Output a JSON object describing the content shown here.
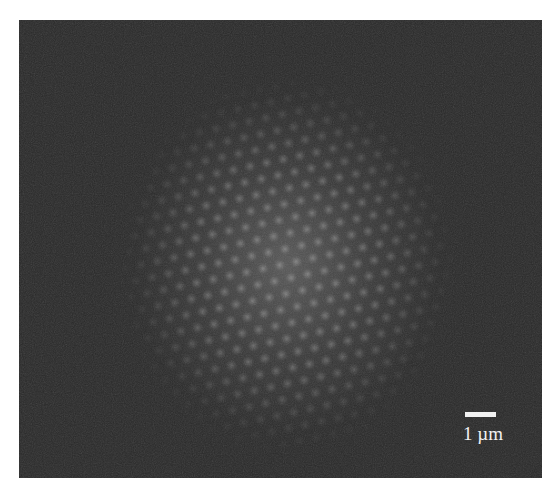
{
  "figure": {
    "background_color": "#292929",
    "glow_color": "#5f5f5f",
    "lattice": {
      "type": "hexagonal",
      "period_px": 17
    },
    "scale_bar": {
      "label": "1 µm",
      "color": "#f2f2f2"
    }
  }
}
